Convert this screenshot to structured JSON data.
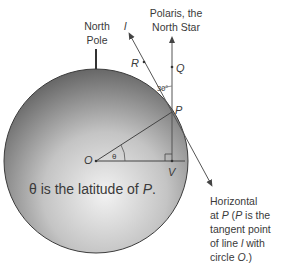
{
  "labels": {
    "north_pole_line1": "North",
    "north_pole_line2": "Pole",
    "line_l": "l",
    "polaris_line1": "Polaris, the",
    "polaris_line2": "North Star",
    "point_R": "R",
    "point_Q": "Q",
    "point_P": "P",
    "point_O": "O",
    "point_V": "V",
    "angle_30": "30°",
    "theta": "θ",
    "caption_prefix": "θ is the latitude of ",
    "caption_point": "P",
    "caption_suffix": ".",
    "horizontal_line1": "Horizontal",
    "horizontal_line2_a": "at ",
    "horizontal_line2_b": "P",
    "horizontal_line2_c": " (",
    "horizontal_line2_d": "P",
    "horizontal_line2_e": " is the",
    "horizontal_line3": "tangent point",
    "horizontal_line4_a": "of line ",
    "horizontal_line4_b": "l",
    "horizontal_line4_c": " with",
    "horizontal_line5_a": "circle ",
    "horizontal_line5_b": "O",
    "horizontal_line5_c": ".)"
  },
  "colors": {
    "circle_edge": "#3c3c3c",
    "circle_light": "#ececec",
    "circle_dark": "#5a5a5a",
    "line": "#555555",
    "text": "#3a3a3a"
  }
}
